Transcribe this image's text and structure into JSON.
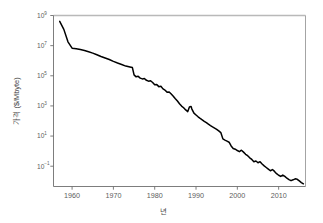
{
  "chart_data": {
    "type": "line",
    "title": "",
    "xlabel": "년",
    "ylabel": "가격 ($/Mbyte)",
    "yscale": "log",
    "xlim": [
      1955.5,
      2016.5
    ],
    "ylim": [
      0.0045,
      1000000000
    ],
    "grid": false,
    "legend": "none",
    "series": [
      {
        "name": "메모리 가격",
        "color": "#000000",
        "x": [
          1957,
          1958,
          1959,
          1960,
          1961,
          1962,
          1963,
          1964,
          1965,
          1966,
          1967,
          1968,
          1969,
          1970,
          1971,
          1972,
          1973,
          1974,
          1974.6,
          1975,
          1975.5,
          1976,
          1976.5,
          1977,
          1977.5,
          1978,
          1978.5,
          1979,
          1979.5,
          1980,
          1980.5,
          1981,
          1981.5,
          1982,
          1982.5,
          1983,
          1983.5,
          1984,
          1984.5,
          1985,
          1985.5,
          1986,
          1986.5,
          1987,
          1987.5,
          1988,
          1988.4,
          1988.8,
          1989,
          1989.5,
          1990,
          1990.5,
          1991,
          1991.5,
          1992,
          1992.5,
          1993,
          1993.5,
          1994,
          1994.5,
          1995,
          1995.5,
          1996,
          1996.5,
          1997,
          1997.5,
          1998,
          1998.5,
          1999,
          1999.5,
          2000,
          2000.5,
          2001,
          2001.5,
          2002,
          2002.5,
          2003,
          2003.5,
          2004,
          2004.5,
          2005,
          2005.5,
          2006,
          2006.5,
          2007,
          2007.5,
          2008,
          2008.5,
          2009,
          2009.5,
          2010,
          2010.5,
          2011,
          2011.5,
          2012,
          2012.5,
          2013,
          2013.5,
          2014,
          2014.5,
          2015,
          2015.5,
          2016
        ],
        "y": [
          411000000,
          120000000,
          18000000,
          6800000,
          6300000,
          5500000,
          4700000,
          3900000,
          3200000,
          2500000,
          1900000,
          1500000,
          1200000,
          900000,
          700000,
          560000,
          440000,
          380000,
          350000,
          115000,
          85000,
          92000,
          70000,
          62000,
          66000,
          50000,
          44000,
          47000,
          36000,
          25000,
          26000,
          19000,
          20000,
          13500,
          11000,
          8200,
          8500,
          6200,
          4400,
          3000,
          2100,
          1400,
          980,
          760,
          540,
          420,
          850,
          930,
          620,
          330,
          250,
          190,
          150,
          120,
          95,
          78,
          62,
          50,
          41,
          34,
          28,
          22,
          17,
          6.5,
          5.4,
          4.6,
          3.9,
          2.2,
          1.5,
          1.35,
          1.1,
          0.92,
          1.15,
          0.86,
          0.62,
          0.5,
          0.36,
          0.28,
          0.2,
          0.22,
          0.17,
          0.2,
          0.14,
          0.105,
          0.082,
          0.064,
          0.05,
          0.06,
          0.045,
          0.032,
          0.025,
          0.021,
          0.026,
          0.021,
          0.016,
          0.013,
          0.011,
          0.0125,
          0.0145,
          0.0135,
          0.0105,
          0.0082,
          0.0068
        ]
      }
    ],
    "yticks": [
      {
        "value": 1000000000,
        "base": "10",
        "exp": "9"
      },
      {
        "value": 10000000,
        "base": "10",
        "exp": "7"
      },
      {
        "value": 100000,
        "base": "10",
        "exp": "5"
      },
      {
        "value": 1000,
        "base": "10",
        "exp": "3"
      },
      {
        "value": 10,
        "base": "10",
        "exp": "1"
      },
      {
        "value": 0.1,
        "base": "10",
        "exp": "−1"
      }
    ],
    "xticks": [
      1960,
      1970,
      1980,
      1990,
      2000,
      2010
    ]
  }
}
